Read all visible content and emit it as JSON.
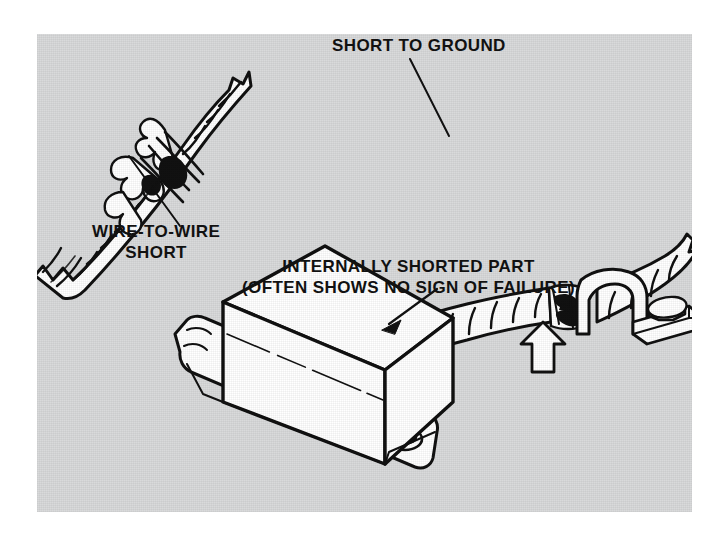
{
  "figure": {
    "kind": "technical-line-illustration",
    "panel_background_color": "#d9dadb",
    "page_background_color": "#ffffff",
    "line_color": "#111111",
    "fill_color": "#ffffff"
  },
  "labels": {
    "short_to_ground": "SHORT TO GROUND",
    "wire_to_wire_line1": "WIRE-TO-WIRE",
    "wire_to_wire_line2": "SHORT",
    "internally_shorted_line1": "INTERNALLY SHORTED PART",
    "internally_shorted_line2": "(OFTEN SHOWS NO SIGN OF FAILURE)"
  },
  "illustrations": {
    "wire_to_wire": {
      "name": "spiral-wrapped wiring harness with torn insulation exposing bare conductors",
      "callout": "WIRE-TO-WIRE SHORT"
    },
    "short_to_ground": {
      "name": "wiring harness chafed against a bolted metal mounting clamp",
      "callout": "SHORT TO GROUND",
      "pointer": "hollow outlined arrow pointing up at the chafe point",
      "fastener": "hex bolt head on flat mounting plate"
    },
    "internally_shorted_part": {
      "name": "rectangular electronic module / relay box with mounting flanges and bolt holes",
      "callout": "INTERNALLY SHORTED PART (OFTEN SHOWS NO SIGN OF FAILURE)"
    }
  }
}
